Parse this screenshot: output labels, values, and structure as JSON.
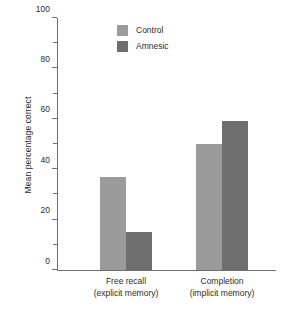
{
  "chart_data": {
    "type": "bar",
    "title": "",
    "xlabel": "",
    "ylabel": "Mean percentage correct",
    "ylim": [
      0,
      100
    ],
    "ytick_labels": [
      "0",
      "20",
      "40",
      "60",
      "80",
      "100"
    ],
    "ytick_values": [
      0,
      20,
      40,
      60,
      80,
      100
    ],
    "yminor_values": [
      10,
      30,
      50,
      70,
      90
    ],
    "grid": false,
    "legend_position": "top-center",
    "categories": [
      {
        "line1": "Free recall",
        "line2": "(explicit memory)"
      },
      {
        "line1": "Completion",
        "line2": "(implicit memory)"
      }
    ],
    "series": [
      {
        "name": "Control",
        "color": "#9b9b9b",
        "values": [
          37,
          50
        ]
      },
      {
        "name": "Amnesic",
        "color": "#6f6f6f",
        "values": [
          15,
          59
        ]
      }
    ]
  }
}
